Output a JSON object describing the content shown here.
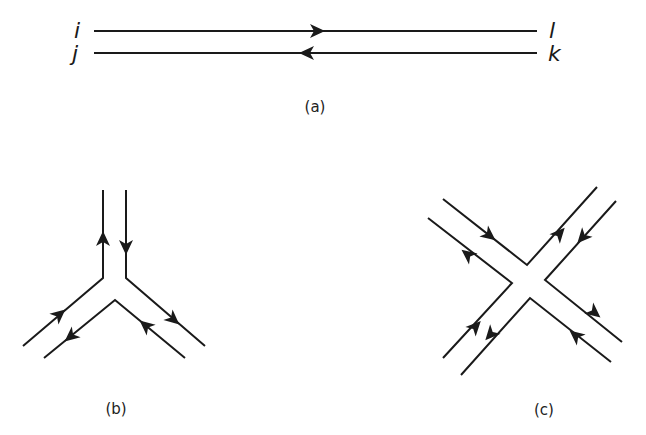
{
  "figure": {
    "panel_a": {
      "caption": "(a)",
      "labels": {
        "top_left": "i",
        "bottom_left": "j",
        "top_right": "l",
        "bottom_right": "k"
      },
      "lines": [
        {
          "name": "upper-line",
          "from": "i",
          "to": "l",
          "direction": "right"
        },
        {
          "name": "lower-line",
          "from": "k",
          "to": "j",
          "direction": "left"
        }
      ]
    },
    "panel_b": {
      "caption": "(b)",
      "description": "three-leg double-line vertex"
    },
    "panel_c": {
      "caption": "(c)",
      "description": "four-leg double-line vertex"
    },
    "colors": {
      "stroke": "#1a1a1a",
      "background": "#ffffff"
    }
  }
}
